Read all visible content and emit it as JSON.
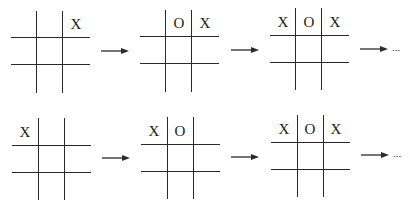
{
  "figure": {
    "rows": [
      {
        "boards": [
          {
            "cells": [
              "",
              "",
              "X",
              "",
              "",
              "",
              "",
              "",
              ""
            ]
          },
          {
            "cells": [
              "",
              "O",
              "X",
              "",
              "",
              "",
              "",
              "",
              ""
            ]
          },
          {
            "cells": [
              "X",
              "O",
              "X",
              "",
              "",
              "",
              "",
              "",
              ""
            ]
          }
        ],
        "continuation": "..."
      },
      {
        "boards": [
          {
            "cells": [
              "X",
              "",
              "",
              "",
              "",
              "",
              "",
              "",
              ""
            ]
          },
          {
            "cells": [
              "X",
              "O",
              "",
              "",
              "",
              "",
              "",
              "",
              ""
            ]
          },
          {
            "cells": [
              "X",
              "O",
              "X",
              "",
              "",
              "",
              "",
              "",
              ""
            ]
          }
        ],
        "continuation": "..."
      }
    ]
  },
  "colors": {
    "line": "#2a2a2a",
    "background": "#ffffff"
  }
}
